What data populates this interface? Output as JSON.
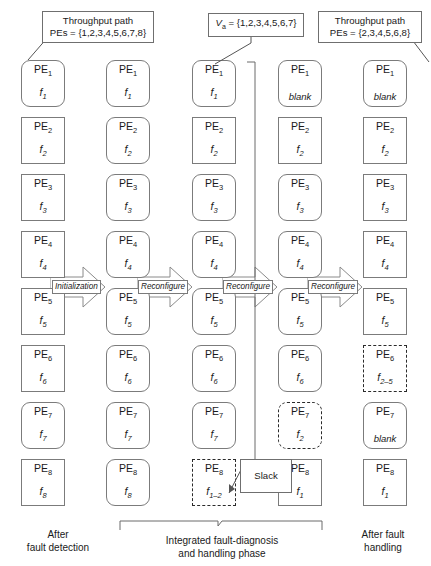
{
  "figure": {
    "title_implicit": "Integrated fault-diagnosis and handling phase PE reconfiguration timeline"
  },
  "callouts": {
    "throughput_left": {
      "line1": "Throughput path",
      "line2_prefix": "PEs = ",
      "line2_set": "{1,2,3,4,5,6,7,8}",
      "line2": "PEs = {1,2,3,4,5,6,7,8}"
    },
    "va": {
      "label": "V",
      "sub": "a",
      "equals_set": "= {1,2,3,4,5,6,7}",
      "full": "Va = {1,2,3,4,5,6,7}"
    },
    "throughput_right": {
      "line1": "Throughput path",
      "line2": "PEs = {2,3,4,5,6,8}"
    },
    "slack": {
      "label": "Slack"
    }
  },
  "arrows": [
    {
      "label": "Initialization"
    },
    {
      "label": "Reconfigure"
    },
    {
      "label": "Reconfigure"
    },
    {
      "label": "Reconfigure"
    }
  ],
  "captions": {
    "left": {
      "line1": "After",
      "line2": "fault detection"
    },
    "middle": {
      "line1": "Integrated fault-diagnosis",
      "line2": "and handling phase"
    },
    "right": {
      "line1": "After fault",
      "line2": "handling"
    }
  },
  "pe_label_prefix": "PE",
  "columns": [
    {
      "name": "after-fault-detection",
      "cells": [
        {
          "pe": "PE",
          "idx": "1",
          "task": "f",
          "task_sub": "1",
          "shape": "round",
          "stroke": "solid"
        },
        {
          "pe": "PE",
          "idx": "2",
          "task": "f",
          "task_sub": "2",
          "shape": "square",
          "stroke": "solid"
        },
        {
          "pe": "PE",
          "idx": "3",
          "task": "f",
          "task_sub": "3",
          "shape": "square",
          "stroke": "solid"
        },
        {
          "pe": "PE",
          "idx": "4",
          "task": "f",
          "task_sub": "4",
          "shape": "square",
          "stroke": "solid"
        },
        {
          "pe": "PE",
          "idx": "5",
          "task": "f",
          "task_sub": "5",
          "shape": "square",
          "stroke": "solid"
        },
        {
          "pe": "PE",
          "idx": "6",
          "task": "f",
          "task_sub": "6",
          "shape": "square",
          "stroke": "solid"
        },
        {
          "pe": "PE",
          "idx": "7",
          "task": "f",
          "task_sub": "7",
          "shape": "round",
          "stroke": "solid"
        },
        {
          "pe": "PE",
          "idx": "8",
          "task": "f",
          "task_sub": "8",
          "shape": "square",
          "stroke": "solid"
        }
      ]
    },
    {
      "name": "initialized",
      "cells": [
        {
          "pe": "PE",
          "idx": "1",
          "task": "f",
          "task_sub": "1",
          "shape": "round",
          "stroke": "solid"
        },
        {
          "pe": "PE",
          "idx": "2",
          "task": "f",
          "task_sub": "2",
          "shape": "round",
          "stroke": "solid"
        },
        {
          "pe": "PE",
          "idx": "3",
          "task": "f",
          "task_sub": "3",
          "shape": "round",
          "stroke": "solid"
        },
        {
          "pe": "PE",
          "idx": "4",
          "task": "f",
          "task_sub": "4",
          "shape": "round",
          "stroke": "solid"
        },
        {
          "pe": "PE",
          "idx": "5",
          "task": "f",
          "task_sub": "5",
          "shape": "round",
          "stroke": "solid"
        },
        {
          "pe": "PE",
          "idx": "6",
          "task": "f",
          "task_sub": "6",
          "shape": "round",
          "stroke": "solid"
        },
        {
          "pe": "PE",
          "idx": "7",
          "task": "f",
          "task_sub": "7",
          "shape": "round",
          "stroke": "solid"
        },
        {
          "pe": "PE",
          "idx": "8",
          "task": "f",
          "task_sub": "8",
          "shape": "round",
          "stroke": "solid"
        }
      ]
    },
    {
      "name": "reconfigure-1",
      "cells": [
        {
          "pe": "PE",
          "idx": "1",
          "task": "f",
          "task_sub": "1",
          "shape": "round",
          "stroke": "solid"
        },
        {
          "pe": "PE",
          "idx": "2",
          "task": "f",
          "task_sub": "2",
          "shape": "square",
          "stroke": "solid"
        },
        {
          "pe": "PE",
          "idx": "3",
          "task": "f",
          "task_sub": "3",
          "shape": "round",
          "stroke": "solid"
        },
        {
          "pe": "PE",
          "idx": "4",
          "task": "f",
          "task_sub": "4",
          "shape": "round",
          "stroke": "solid"
        },
        {
          "pe": "PE",
          "idx": "5",
          "task": "f",
          "task_sub": "5",
          "shape": "round",
          "stroke": "solid"
        },
        {
          "pe": "PE",
          "idx": "6",
          "task": "f",
          "task_sub": "6",
          "shape": "round",
          "stroke": "solid"
        },
        {
          "pe": "PE",
          "idx": "7",
          "task": "f",
          "task_sub": "7",
          "shape": "round",
          "stroke": "solid"
        },
        {
          "pe": "PE",
          "idx": "8",
          "task": "f",
          "task_sub": "1–2",
          "shape": "square",
          "stroke": "dashed"
        }
      ]
    },
    {
      "name": "reconfigure-2",
      "cells": [
        {
          "pe": "PE",
          "idx": "1",
          "task": "blank",
          "task_sub": "",
          "shape": "round",
          "stroke": "solid"
        },
        {
          "pe": "PE",
          "idx": "2",
          "task": "f",
          "task_sub": "2",
          "shape": "square",
          "stroke": "solid"
        },
        {
          "pe": "PE",
          "idx": "3",
          "task": "f",
          "task_sub": "3",
          "shape": "round",
          "stroke": "solid"
        },
        {
          "pe": "PE",
          "idx": "4",
          "task": "f",
          "task_sub": "4",
          "shape": "round",
          "stroke": "solid"
        },
        {
          "pe": "PE",
          "idx": "5",
          "task": "f",
          "task_sub": "5",
          "shape": "round",
          "stroke": "solid"
        },
        {
          "pe": "PE",
          "idx": "6",
          "task": "f",
          "task_sub": "6",
          "shape": "round",
          "stroke": "solid"
        },
        {
          "pe": "PE",
          "idx": "7",
          "task": "f",
          "task_sub": "2",
          "shape": "round",
          "stroke": "dashed"
        },
        {
          "pe": "PE",
          "idx": "8",
          "task": "f",
          "task_sub": "1",
          "shape": "square",
          "stroke": "solid"
        }
      ]
    },
    {
      "name": "after-fault-handling",
      "cells": [
        {
          "pe": "PE",
          "idx": "1",
          "task": "blank",
          "task_sub": "",
          "shape": "round",
          "stroke": "solid"
        },
        {
          "pe": "PE",
          "idx": "2",
          "task": "f",
          "task_sub": "2",
          "shape": "square",
          "stroke": "solid"
        },
        {
          "pe": "PE",
          "idx": "3",
          "task": "f",
          "task_sub": "3",
          "shape": "square",
          "stroke": "solid"
        },
        {
          "pe": "PE",
          "idx": "4",
          "task": "f",
          "task_sub": "4",
          "shape": "square",
          "stroke": "solid"
        },
        {
          "pe": "PE",
          "idx": "5",
          "task": "f",
          "task_sub": "5",
          "shape": "square",
          "stroke": "solid"
        },
        {
          "pe": "PE",
          "idx": "6",
          "task": "f",
          "task_sub": "2–5",
          "shape": "square",
          "stroke": "dashed"
        },
        {
          "pe": "PE",
          "idx": "7",
          "task": "blank",
          "task_sub": "",
          "shape": "round",
          "stroke": "solid"
        },
        {
          "pe": "PE",
          "idx": "8",
          "task": "f",
          "task_sub": "1",
          "shape": "square",
          "stroke": "solid"
        }
      ]
    }
  ],
  "colors": {
    "box_stroke": "#7b7b7b",
    "dashed_stroke": "#2a2a2a",
    "text": "#1a1a1a",
    "background": "#ffffff"
  }
}
